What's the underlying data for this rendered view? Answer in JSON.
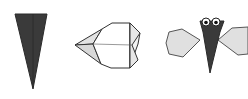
{
  "diagram": {
    "type": "origami-step-sequence",
    "steps": [
      {
        "name": "dark-cone",
        "description": "Dark folded triangle pointing down"
      },
      {
        "name": "folded-base",
        "description": "Pale folded shape with point to the left"
      },
      {
        "name": "finished-bug",
        "description": "Dark body with two eyes and pale wings"
      }
    ],
    "colors": {
      "dark_fill": "#3a3a3a",
      "light_fill": "#e2e2e2",
      "paper_white": "#ffffff",
      "stroke": "#333333",
      "background": "#ffffff"
    }
  }
}
